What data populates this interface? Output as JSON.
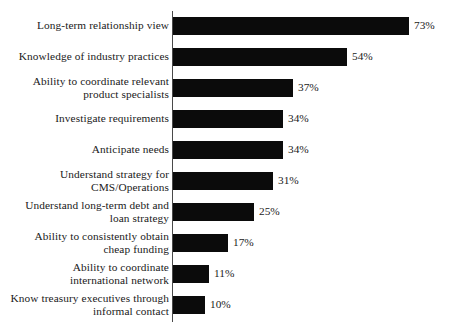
{
  "chart_data": {
    "type": "bar",
    "orientation": "horizontal",
    "title": "",
    "subtitle": "",
    "xlabel": "",
    "ylabel": "",
    "xlim": [
      0,
      73
    ],
    "grid": false,
    "legend": null,
    "value_suffix": "%",
    "bar_color": "#0b0b0b",
    "axis_color": "#4a4a4a",
    "background_color": "#ffffff",
    "categories": [
      "Long-term relationship view",
      "Ability to coordinate relevant\nproduct specialists",
      "Knowledge of industry practices",
      "Investigate requirements",
      "Anticipate needs",
      "Understand strategy for\nCMS/Operations",
      "Understand long-term debt and\nloan strategy",
      "Ability to consistently obtain\ncheap funding",
      "Ability to coordinate\ninternational network",
      "Know treasury executives through\ninformal contact"
    ],
    "values": [
      73,
      54,
      37,
      34,
      34,
      31,
      25,
      17,
      11,
      10
    ],
    "bars": [
      {
        "category": "Long-term relationship view",
        "lines": 1,
        "value": 73,
        "value_label": "73%"
      },
      {
        "category": "Knowledge of industry practices",
        "lines": 1,
        "value": 54,
        "value_label": "54%"
      },
      {
        "category": "Ability to coordinate relevant\nproduct specialists",
        "lines": 2,
        "value": 37,
        "value_label": "37%"
      },
      {
        "category": "Investigate requirements",
        "lines": 1,
        "value": 34,
        "value_label": "34%"
      },
      {
        "category": "Anticipate needs",
        "lines": 1,
        "value": 34,
        "value_label": "34%"
      },
      {
        "category": "Understand strategy for\nCMS/Operations",
        "lines": 2,
        "value": 31,
        "value_label": "31%"
      },
      {
        "category": "Understand long-term debt and\nloan strategy",
        "lines": 2,
        "value": 25,
        "value_label": "25%"
      },
      {
        "category": "Ability to consistently obtain\ncheap funding",
        "lines": 2,
        "value": 17,
        "value_label": "17%"
      },
      {
        "category": "Ability to coordinate\ninternational network",
        "lines": 2,
        "value": 11,
        "value_label": "11%"
      },
      {
        "category": "Know treasury executives through\ninformal contact",
        "lines": 2,
        "value": 10,
        "value_label": "10%"
      }
    ]
  }
}
